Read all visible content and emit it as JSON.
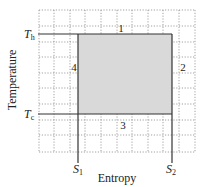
{
  "diagram": {
    "type": "T-S diagram (Carnot cycle)",
    "xlabel": "Entropy",
    "ylabel": "Temperature",
    "t_hot": {
      "symbol": "T",
      "sub": "h"
    },
    "t_cold": {
      "symbol": "T",
      "sub": "c"
    },
    "s1": {
      "symbol": "S",
      "sub": "1"
    },
    "s2": {
      "symbol": "S",
      "sub": "2"
    },
    "segments": [
      {
        "label": "1",
        "side": "top"
      },
      {
        "label": "2",
        "side": "right"
      },
      {
        "label": "3",
        "side": "bottom"
      },
      {
        "label": "4",
        "side": "left"
      }
    ],
    "colors": {
      "fill": "#d9d9d9",
      "line": "#333333",
      "grid": "#888888"
    }
  }
}
